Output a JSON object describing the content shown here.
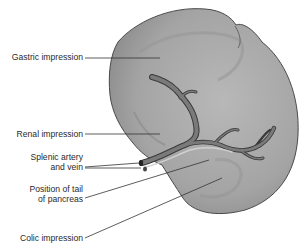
{
  "figure": {
    "colors": {
      "organ_fill": "#a9a9a9",
      "organ_edge": "#4a4a4a",
      "vessel_dark": "#5a5a5a",
      "vessel_light": "#c8c8c8",
      "leader_line": "#333333",
      "background": "#ffffff"
    },
    "labels": [
      {
        "id": "gastric",
        "lines": [
          "Gastric impression"
        ]
      },
      {
        "id": "renal",
        "lines": [
          "Renal impression"
        ]
      },
      {
        "id": "splenic",
        "lines": [
          "Splenic artery",
          "and vein"
        ]
      },
      {
        "id": "pancreas",
        "lines": [
          "Position of tail",
          "of pancreas"
        ]
      },
      {
        "id": "colic",
        "lines": [
          "Colic impression"
        ]
      }
    ]
  }
}
